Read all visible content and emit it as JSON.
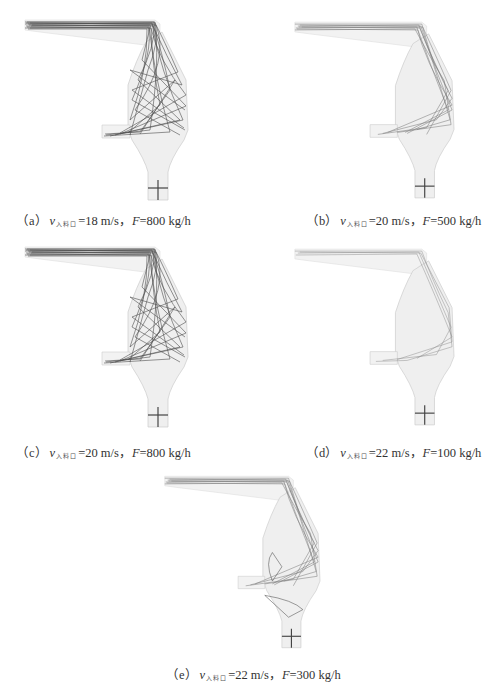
{
  "figure": {
    "panels": [
      {
        "id": "a",
        "label": "（a）",
        "var": "v",
        "subscript": "入料口",
        "velocity": "=18 m/s，",
        "flow_var": "F",
        "flow": "=800 kg/h",
        "trajectory_density": "high"
      },
      {
        "id": "b",
        "label": "（b）",
        "var": "v",
        "subscript": "入料口",
        "velocity": "=20 m/s，",
        "flow_var": "F",
        "flow": "=500 kg/h",
        "trajectory_density": "medium"
      },
      {
        "id": "c",
        "label": "（c）",
        "var": "v",
        "subscript": "入料口",
        "velocity": "=20 m/s，",
        "flow_var": "F",
        "flow": "=800 kg/h",
        "trajectory_density": "high"
      },
      {
        "id": "d",
        "label": "（d）",
        "var": "v",
        "subscript": "入料口",
        "velocity": "=22 m/s，",
        "flow_var": "F",
        "flow": "=100 kg/h",
        "trajectory_density": "low"
      },
      {
        "id": "e",
        "label": "（e）",
        "var": "v",
        "subscript": "入料口",
        "velocity": "=22 m/s，",
        "flow_var": "F",
        "flow": "=300 kg/h",
        "trajectory_density": "medium"
      }
    ],
    "colors": {
      "chamber_fill": "#eeeeee",
      "chamber_edge": "#cccccc",
      "trajectory": "#333333",
      "trajectory_light": "#888888"
    }
  }
}
